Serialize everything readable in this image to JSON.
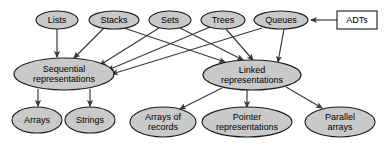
{
  "diagram": {
    "style": {
      "node_fill": "#c9c9c9",
      "node_stroke": "#1a1a1a",
      "edge_stroke": "#3a3a3a",
      "text_color": "#000000",
      "background": "#ffffff"
    },
    "nodes": [
      {
        "id": "adts",
        "label": "ADTs",
        "shape": "rect",
        "cx": 357,
        "cy": 20,
        "rx": 20,
        "ry": 9,
        "lines": [
          "ADTs"
        ]
      },
      {
        "id": "lists",
        "label": "Lists",
        "shape": "ellipse",
        "cx": 57,
        "cy": 20,
        "rx": 21,
        "ry": 9,
        "lines": [
          "Lists"
        ]
      },
      {
        "id": "stacks",
        "label": "Stacks",
        "shape": "ellipse",
        "cx": 114,
        "cy": 20,
        "rx": 25,
        "ry": 9,
        "lines": [
          "Stacks"
        ]
      },
      {
        "id": "sets",
        "label": "Sets",
        "shape": "ellipse",
        "cx": 170,
        "cy": 20,
        "rx": 21,
        "ry": 9,
        "lines": [
          "Sets"
        ]
      },
      {
        "id": "trees",
        "label": "Trees",
        "shape": "ellipse",
        "cx": 223,
        "cy": 20,
        "rx": 22,
        "ry": 9,
        "lines": [
          "Trees"
        ]
      },
      {
        "id": "queues",
        "label": "Queues",
        "shape": "ellipse",
        "cx": 281,
        "cy": 20,
        "rx": 27,
        "ry": 9,
        "lines": [
          "Queues"
        ]
      },
      {
        "id": "sequential",
        "label": "Sequential representations",
        "shape": "ellipse",
        "cx": 64,
        "cy": 74,
        "rx": 50,
        "ry": 16,
        "lines": [
          "Sequential",
          "representations"
        ]
      },
      {
        "id": "linked",
        "label": "Linked representations",
        "shape": "ellipse",
        "cx": 252,
        "cy": 75,
        "rx": 49,
        "ry": 15,
        "lines": [
          "Linked",
          "representations"
        ]
      },
      {
        "id": "arrays",
        "label": "Arrays",
        "shape": "ellipse",
        "cx": 37,
        "cy": 120,
        "rx": 25,
        "ry": 13,
        "lines": [
          "Arrays"
        ]
      },
      {
        "id": "strings",
        "label": "Strings",
        "shape": "ellipse",
        "cx": 90,
        "cy": 120,
        "rx": 25,
        "ry": 13,
        "lines": [
          "Strings"
        ]
      },
      {
        "id": "arrays_of_records",
        "label": "Arrays of records",
        "shape": "ellipse",
        "cx": 163,
        "cy": 122,
        "rx": 33,
        "ry": 15,
        "lines": [
          "Arrays of",
          "records"
        ]
      },
      {
        "id": "pointer",
        "label": "Pointer representations",
        "shape": "ellipse",
        "cx": 247,
        "cy": 122,
        "rx": 45,
        "ry": 15,
        "lines": [
          "Pointer",
          "representations"
        ]
      },
      {
        "id": "parallel",
        "label": "Parallel arrays",
        "shape": "ellipse",
        "cx": 340,
        "cy": 122,
        "rx": 35,
        "ry": 15,
        "lines": [
          "Parallel",
          "arrays"
        ]
      }
    ],
    "edges": [
      {
        "from": "adts",
        "to": "queues",
        "x1": 337,
        "y1": 20,
        "x2": 311,
        "y2": 20
      },
      {
        "from": "lists",
        "to": "sequential",
        "x1": 57,
        "y1": 29,
        "x2": 57,
        "y2": 57
      },
      {
        "from": "stacks",
        "to": "sequential",
        "x1": 104,
        "y1": 28,
        "x2": 74,
        "y2": 58
      },
      {
        "from": "stacks",
        "to": "linked",
        "x1": 124,
        "y1": 28,
        "x2": 225,
        "y2": 62
      },
      {
        "from": "sets",
        "to": "sequential",
        "x1": 159,
        "y1": 28,
        "x2": 100,
        "y2": 65
      },
      {
        "from": "sets",
        "to": "linked",
        "x1": 180,
        "y1": 28,
        "x2": 243,
        "y2": 60
      },
      {
        "from": "trees",
        "to": "sequential",
        "x1": 210,
        "y1": 27,
        "x2": 108,
        "y2": 70
      },
      {
        "from": "trees",
        "to": "linked",
        "x1": 226,
        "y1": 29,
        "x2": 253,
        "y2": 60
      },
      {
        "from": "queues",
        "to": "sequential",
        "x1": 262,
        "y1": 28,
        "x2": 112,
        "y2": 74
      },
      {
        "from": "queues",
        "to": "linked",
        "x1": 284,
        "y1": 29,
        "x2": 278,
        "y2": 62
      },
      {
        "from": "sequential",
        "to": "arrays",
        "x1": 38,
        "y1": 89,
        "x2": 38,
        "y2": 106
      },
      {
        "from": "sequential",
        "to": "strings",
        "x1": 90,
        "y1": 89,
        "x2": 90,
        "y2": 106
      },
      {
        "from": "linked",
        "to": "arrays_of_records",
        "x1": 222,
        "y1": 88,
        "x2": 180,
        "y2": 109
      },
      {
        "from": "linked",
        "to": "pointer",
        "x1": 247,
        "y1": 90,
        "x2": 247,
        "y2": 107
      },
      {
        "from": "linked",
        "to": "parallel",
        "x1": 286,
        "y1": 87,
        "x2": 322,
        "y2": 108
      }
    ]
  }
}
